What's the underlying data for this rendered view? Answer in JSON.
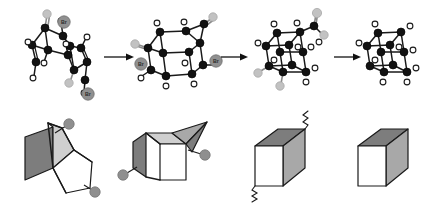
{
  "figure": {
    "background_color": "#ffffff",
    "width": 432,
    "height": 203,
    "rows": [
      {
        "row_name": "molecular-scheme",
        "description": "Top row: four molecular structures connected by reaction arrows"
      },
      {
        "row_name": "folding-analogy",
        "description": "Bottom row: four origami/paper-folding shapes showing progressive cube formation"
      }
    ]
  },
  "colors": {
    "carbon": "#121212",
    "hydrogen": "#ffffff",
    "bromine": "#909090",
    "gray_atom": "#c2c2c2",
    "bond": "#1a1a1a",
    "arrow": "#111111",
    "face_dark": "#7d7d7d",
    "face_mid": "#a8a8a8",
    "face_light": "#cfcfcf",
    "face_white": "#ffffff",
    "knob": "#8f8f8f"
  },
  "molecules": [
    {
      "id": "structure-1",
      "name": "dibromo-precursor",
      "label": "",
      "substituent_labels": [
        "Br",
        "Br"
      ],
      "bromine_count": 2,
      "gray_atom_count": 2,
      "geometry": "open bicyclic cage with two alkene bridges"
    },
    {
      "id": "structure-2",
      "name": "partially-closed-cage",
      "label": "",
      "substituent_labels": [
        "Br",
        "Br"
      ],
      "bromine_count": 2,
      "gray_atom_count": 2,
      "geometry": "near-cubic cage with one pendant arm"
    },
    {
      "id": "structure-3",
      "name": "cubane-with-pendant",
      "label": "",
      "substituent_labels": [],
      "bromine_count": 0,
      "gray_atom_count": 3,
      "geometry": "cubane core with exocyclic gray substituents"
    },
    {
      "id": "structure-4",
      "name": "cubane",
      "label": "",
      "substituent_labels": [],
      "bromine_count": 0,
      "gray_atom_count": 0,
      "geometry": "complete cubane, C8H8"
    }
  ],
  "arrows": [
    {
      "id": "arrow-1",
      "from": "structure-1",
      "to": "structure-2",
      "label": ""
    },
    {
      "id": "arrow-2",
      "from": "structure-2",
      "to": "structure-3",
      "label": ""
    },
    {
      "id": "arrow-3",
      "from": "structure-3",
      "to": "structure-4",
      "label": ""
    }
  ],
  "folding_shapes": [
    {
      "id": "fold-1",
      "name": "unfolded-sheet",
      "knob_count": 2,
      "faces": [
        "dark",
        "light",
        "white"
      ],
      "squiggle_count": 0,
      "description": "flat creased sheet with two gray knobs on tabs"
    },
    {
      "id": "fold-2",
      "name": "partially-folded-box",
      "knob_count": 2,
      "faces": [
        "dark",
        "light",
        "mid",
        "white"
      ],
      "squiggle_count": 0,
      "description": "half-folded box with open flaps and two knobs"
    },
    {
      "id": "fold-3",
      "name": "closed-box-with-seams",
      "knob_count": 0,
      "faces": [
        "dark",
        "mid",
        "white"
      ],
      "squiggle_count": 2,
      "description": "closed cube with two zigzag seam marks"
    },
    {
      "id": "fold-4",
      "name": "finished-cube",
      "knob_count": 0,
      "faces": [
        "dark",
        "mid",
        "white"
      ],
      "squiggle_count": 0,
      "description": "clean finished cube"
    }
  ]
}
